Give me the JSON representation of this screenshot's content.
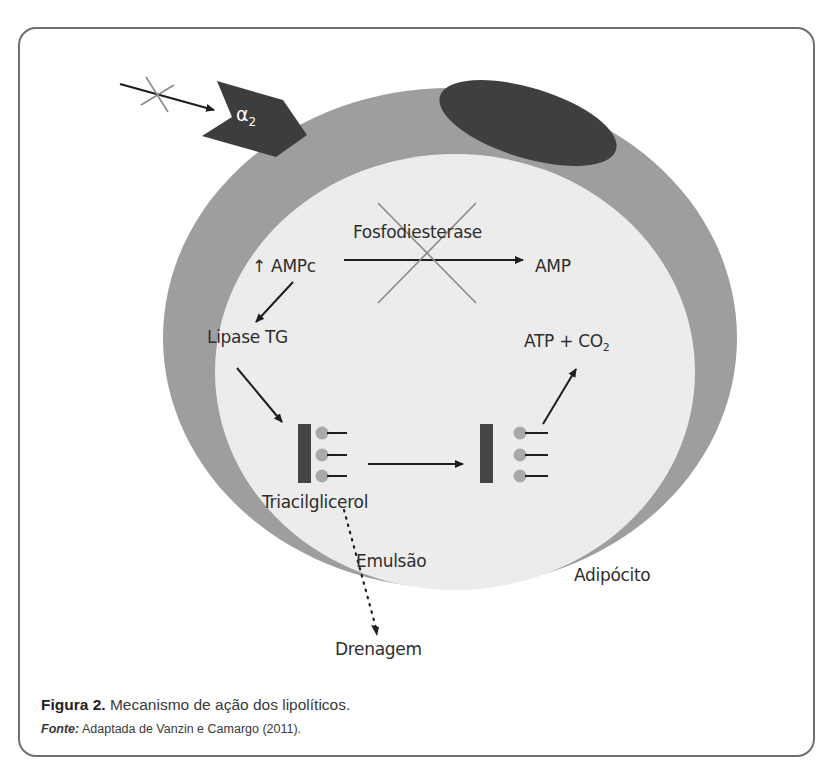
{
  "figure": {
    "caption_label": "Figura 2.",
    "caption_text": " Mecanismo de ação dos lipolíticos.",
    "source_label": "Fonte:",
    "source_text": " Adaptada de Vanzin e Camargo (2011)."
  },
  "diagram": {
    "receptor_label": "α",
    "receptor_subscript": "2",
    "nodes": {
      "enzyme_blocked": "Fosfodiesterase",
      "ampc": "↑ AMPc",
      "amp": "AMP",
      "lipase": "Lipase TG",
      "atp": "ATP + CO",
      "atp_subscript": "2",
      "triglyceride": "Triacilglicerol",
      "emulsion": "Emulsão",
      "cell": "Adipócito",
      "drainage": "Drenagem"
    },
    "colors": {
      "cell_membrane": "#9e9e9e",
      "cytoplasm": "#ececec",
      "nucleus": "#3f3f3f",
      "receptor": "#3d3d3d",
      "glycerol_bar": "#454545",
      "fatty_acid_head": "#a9a9a9",
      "inhibition_cross": "#8a8a8a",
      "arrow": "#1e1e1e"
    }
  }
}
